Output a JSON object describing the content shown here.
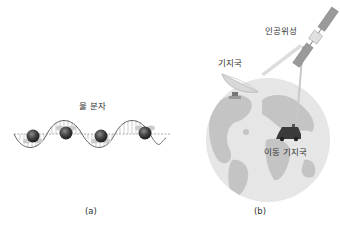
{
  "panel_a": {
    "title": "물 분자",
    "caption": "(a)",
    "molecule_count": 4
  },
  "panel_b": {
    "satellite_label": "인공위성",
    "base_station_label": "기지국",
    "mobile_station_label": "이동 기지국",
    "caption": "(b)"
  },
  "colors": {
    "globe_ocean": "#e6e6e6",
    "globe_land": "#c4c4c4",
    "molecule": "#3a3a3a",
    "wave": "#555555",
    "text": "#333333"
  }
}
